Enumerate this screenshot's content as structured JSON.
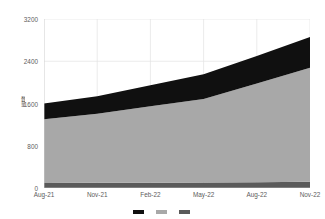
{
  "chart_data": {
    "type": "area",
    "stacked": true,
    "title": "",
    "subtitle": "",
    "xlabel": "",
    "ylabel": "数量",
    "categories": [
      "Aug-21",
      "Nov-21",
      "Feb-22",
      "May-22",
      "Aug-22",
      "Nov-22"
    ],
    "x": [
      "Aug-21",
      "Nov-21",
      "Feb-22",
      "May-22",
      "Aug-22",
      "Nov-22"
    ],
    "xtick_labels": [
      "Aug-21",
      "Nov-21",
      "Feb-22",
      "May-22",
      "Aug-22",
      "Nov-22"
    ],
    "ytick_labels": [
      "0",
      "800",
      "1600",
      "2400",
      "3200"
    ],
    "yticks": [
      0,
      800,
      1600,
      2400,
      3200
    ],
    "ylim": [
      0,
      3200
    ],
    "grid": "vertical-and-horizontal-light",
    "legend_position": "bottom",
    "series": [
      {
        "name": "Series 1",
        "color": "#5a5a5a",
        "values": [
          95,
          98,
          100,
          104,
          110,
          118
        ]
      },
      {
        "name": "Series 2",
        "color": "#a8a8a8",
        "values": [
          1205,
          1310,
          1450,
          1580,
          1870,
          2160
        ]
      },
      {
        "name": "Series 3",
        "color": "#101010",
        "values": [
          300,
          330,
          395,
          470,
          520,
          580
        ]
      }
    ],
    "cumulative_totals": [
      1600,
      1738,
      1945,
      2154,
      2500,
      2858
    ],
    "annotations": []
  },
  "legend": {
    "items": [
      {
        "label": "",
        "color": "#101010"
      },
      {
        "label": "",
        "color": "#a8a8a8"
      },
      {
        "label": "",
        "color": "#5a5a5a"
      }
    ]
  },
  "axis": {
    "y_title": "数量"
  }
}
